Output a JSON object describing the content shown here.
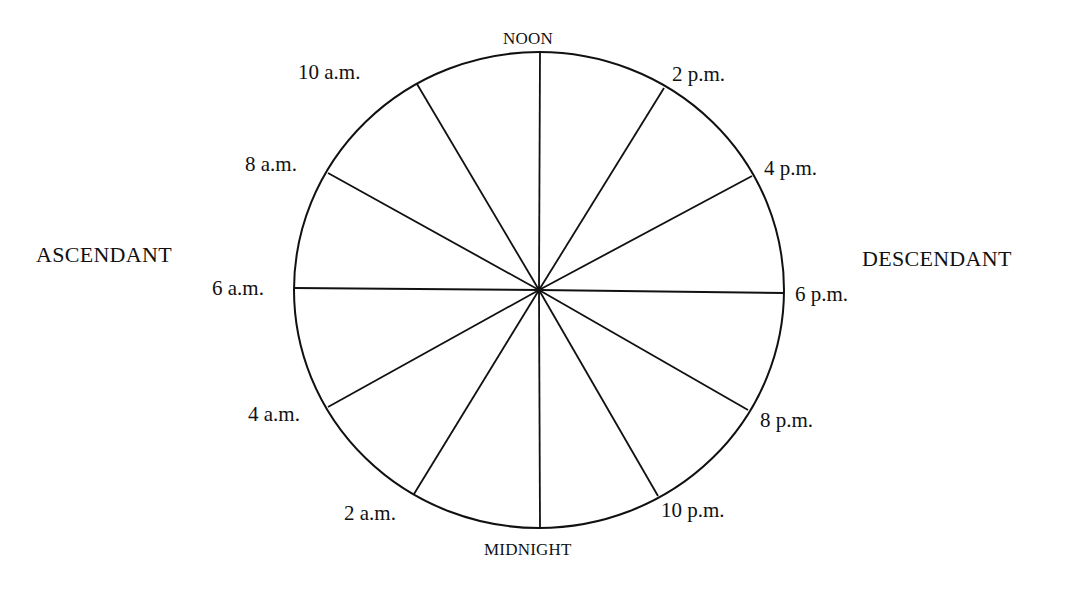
{
  "diagram": {
    "type": "house-clock-wheel",
    "center": {
      "x": 539,
      "y": 290
    },
    "radius": {
      "x": 245,
      "y": 238
    },
    "stroke_color": "#111111",
    "background_color": "#ffffff",
    "sections": 12
  },
  "labels": {
    "top": "NOON",
    "bottom": "MIDNIGHT",
    "left_side": "ASCENDANT",
    "right_side": "DESCENDANT"
  },
  "hours": [
    {
      "key": "noon",
      "label": "NOON",
      "end": {
        "x": 540,
        "y": 52
      }
    },
    {
      "key": "2pm",
      "label": "2 p.m.",
      "end": {
        "x": 664,
        "y": 88
      }
    },
    {
      "key": "4pm",
      "label": "4 p.m.",
      "end": {
        "x": 752,
        "y": 176
      }
    },
    {
      "key": "6pm",
      "label": "6 p.m.",
      "end": {
        "x": 784,
        "y": 293
      }
    },
    {
      "key": "8pm",
      "label": "8 p.m.",
      "end": {
        "x": 748,
        "y": 410
      }
    },
    {
      "key": "10pm",
      "label": "10 p.m.",
      "end": {
        "x": 658,
        "y": 496
      }
    },
    {
      "key": "midnight",
      "label": "MIDNIGHT",
      "end": {
        "x": 540,
        "y": 528
      }
    },
    {
      "key": "2am",
      "label": "2 a.m.",
      "end": {
        "x": 414,
        "y": 494
      }
    },
    {
      "key": "4am",
      "label": "4 a.m.",
      "end": {
        "x": 328,
        "y": 407
      }
    },
    {
      "key": "6am",
      "label": "6 a.m.",
      "end": {
        "x": 294,
        "y": 288
      }
    },
    {
      "key": "8am",
      "label": "8 a.m.",
      "end": {
        "x": 328,
        "y": 173
      }
    },
    {
      "key": "10am",
      "label": "10 a.m.",
      "end": {
        "x": 417,
        "y": 84
      }
    }
  ]
}
